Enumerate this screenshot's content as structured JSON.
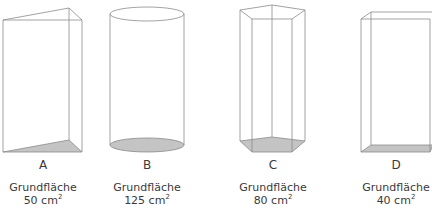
{
  "figure": {
    "caption_word": "Grundfläche",
    "unit": "cm",
    "unit_power": "2",
    "edge_color": "#8a8a8a",
    "base_fill": "#c4c4c4"
  },
  "solids": [
    {
      "letter": "A",
      "shape": "triangular prism",
      "area_value": "50",
      "area_text": "50 cm"
    },
    {
      "letter": "B",
      "shape": "cylinder",
      "area_value": "125",
      "area_text": "125 cm"
    },
    {
      "letter": "C",
      "shape": "pentagonal prism",
      "area_value": "80",
      "area_text": "80 cm"
    },
    {
      "letter": "D",
      "shape": "rectangular prism",
      "area_value": "40",
      "area_text": "40 cm"
    }
  ]
}
